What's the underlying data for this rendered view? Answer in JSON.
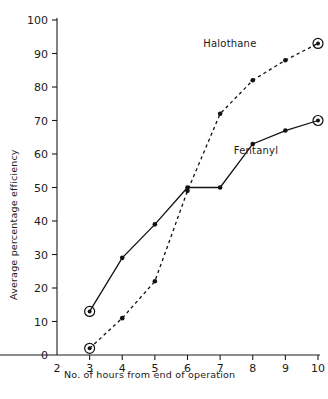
{
  "chart_data": {
    "type": "line",
    "title": "",
    "xlabel": "No. of hours from end of operation",
    "ylabel": "Average percentage efficiency",
    "xlim": [
      2,
      10
    ],
    "ylim": [
      0,
      100
    ],
    "xticks": [
      2,
      3,
      4,
      5,
      6,
      7,
      8,
      9,
      10
    ],
    "yticks": [
      0,
      10,
      20,
      30,
      40,
      50,
      60,
      70,
      80,
      90,
      100
    ],
    "xtick_labels": [
      "2",
      "3",
      "4",
      "5",
      "6",
      "7",
      "8",
      "9",
      "10"
    ],
    "ytick_labels": [
      "0",
      "10",
      "20",
      "30",
      "40",
      "50",
      "60",
      "70",
      "80",
      "90",
      "100"
    ],
    "grid": false,
    "legend_position": "inline-annotation",
    "series": [
      {
        "name": "Fentanyl",
        "style": "solid",
        "x": [
          3,
          4,
          5,
          6,
          7,
          8,
          9,
          10
        ],
        "values": [
          13,
          29,
          39,
          50,
          50,
          63,
          67,
          70
        ],
        "endpoint_markers": [
          3,
          10
        ]
      },
      {
        "name": "Halothane",
        "style": "dashed",
        "x": [
          3,
          4,
          5,
          6,
          7,
          8,
          9,
          10
        ],
        "values": [
          2,
          11,
          22,
          49,
          72,
          82,
          88,
          93
        ],
        "endpoint_markers": [
          3,
          10
        ]
      }
    ],
    "annotations": [
      {
        "text": "Halothane",
        "x": 7.3,
        "y": 92
      },
      {
        "text": "Fentanyl",
        "x": 8.1,
        "y": 60
      }
    ]
  },
  "axis": {
    "y_title": "Average percentage efficiency",
    "x_title": "No. of hours from end of operation"
  },
  "labels": {
    "halothane": "Halothane",
    "fentanyl": "Fentanyl"
  },
  "colors": {
    "ink": "#111111",
    "background": "#ffffff"
  }
}
